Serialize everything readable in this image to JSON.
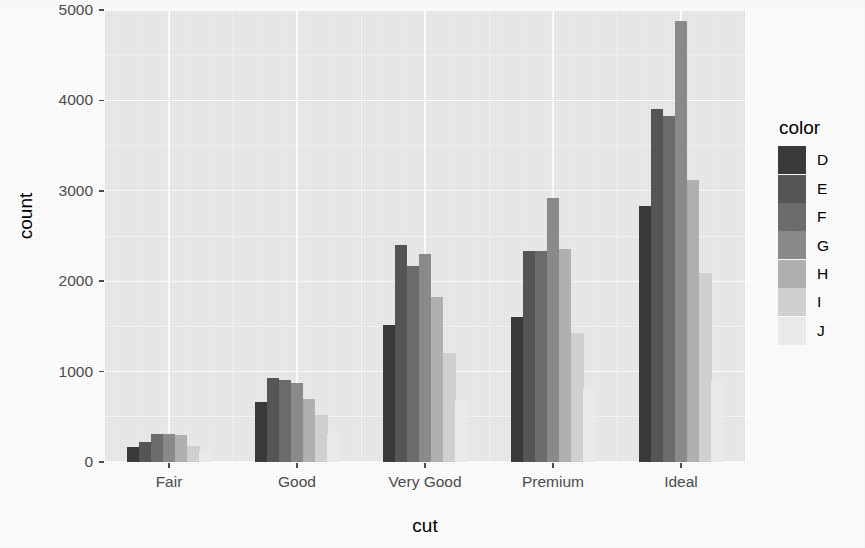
{
  "chart_data": {
    "type": "bar",
    "title": "",
    "subtitle": "",
    "xlabel": "cut",
    "ylabel": "count",
    "categories": [
      "Fair",
      "Good",
      "Very Good",
      "Premium",
      "Ideal"
    ],
    "ylim": [
      0,
      5000
    ],
    "y_ticks": [
      0,
      1000,
      2000,
      3000,
      4000,
      5000
    ],
    "y_tick_labels": [
      "0",
      "1000",
      "2000",
      "3000",
      "4000",
      "5000"
    ],
    "grid": true,
    "grid_major_color": "#ffffff",
    "grid_minor_color": "#f5f5f5",
    "panel_background": "#ebebeb",
    "legend": {
      "title": "color",
      "position": "right",
      "entries": [
        {
          "label": "D",
          "color": "#3b3b3b"
        },
        {
          "label": "E",
          "color": "#575757"
        },
        {
          "label": "F",
          "color": "#6e6e6e"
        },
        {
          "label": "G",
          "color": "#8d8d8d"
        },
        {
          "label": "H",
          "color": "#b4b4b4"
        },
        {
          "label": "I",
          "color": "#d4d4d4"
        },
        {
          "label": "J",
          "color": "#efefef"
        }
      ]
    },
    "series": [
      {
        "name": "D",
        "color": "#3b3b3b",
        "values": [
          163,
          662,
          1513,
          1603,
          2834
        ]
      },
      {
        "name": "E",
        "color": "#575757",
        "values": [
          224,
          933,
          2400,
          2337,
          3903
        ]
      },
      {
        "name": "F",
        "color": "#6e6e6e",
        "values": [
          312,
          909,
          2164,
          2331,
          3826
        ]
      },
      {
        "name": "G",
        "color": "#8d8d8d",
        "values": [
          314,
          871,
          2299,
          2924,
          4884
        ]
      },
      {
        "name": "H",
        "color": "#b4b4b4",
        "values": [
          303,
          702,
          1824,
          2360,
          3115
        ]
      },
      {
        "name": "I",
        "color": "#d4d4d4",
        "values": [
          175,
          522,
          1204,
          1428,
          2093
        ]
      },
      {
        "name": "J",
        "color": "#efefef",
        "values": [
          119,
          307,
          678,
          808,
          896
        ]
      }
    ]
  },
  "axis": {
    "x_title": "cut",
    "y_title": "count"
  }
}
